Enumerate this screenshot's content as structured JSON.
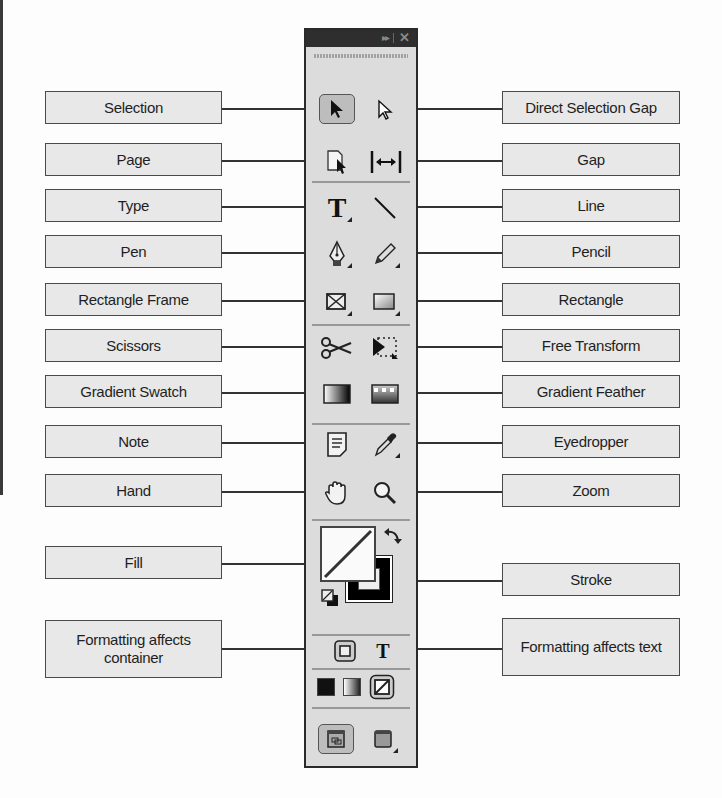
{
  "labels_left": [
    {
      "id": "selection",
      "text": "Selection"
    },
    {
      "id": "page",
      "text": "Page"
    },
    {
      "id": "type",
      "text": "Type"
    },
    {
      "id": "pen",
      "text": "Pen"
    },
    {
      "id": "rectangle-frame",
      "text": "Rectangle Frame"
    },
    {
      "id": "scissors",
      "text": "Scissors"
    },
    {
      "id": "gradient-swatch",
      "text": "Gradient Swatch"
    },
    {
      "id": "note",
      "text": "Note"
    },
    {
      "id": "hand",
      "text": "Hand"
    },
    {
      "id": "fill",
      "text": "Fill"
    },
    {
      "id": "formatting-container",
      "text": "Formatting affects container"
    }
  ],
  "labels_right": [
    {
      "id": "direct-selection",
      "text": "Direct Selection Gap"
    },
    {
      "id": "gap",
      "text": "Gap"
    },
    {
      "id": "line",
      "text": "Line"
    },
    {
      "id": "pencil",
      "text": "Pencil"
    },
    {
      "id": "rectangle",
      "text": "Rectangle"
    },
    {
      "id": "free-transform",
      "text": "Free Transform"
    },
    {
      "id": "gradient-feather",
      "text": "Gradient Feather"
    },
    {
      "id": "eyedropper",
      "text": "Eyedropper"
    },
    {
      "id": "zoom",
      "text": "Zoom"
    },
    {
      "id": "stroke",
      "text": "Stroke"
    },
    {
      "id": "formatting-text",
      "text": "Formatting affects text"
    }
  ],
  "panel": {
    "title_expand_icon": "▸▸",
    "title_close_icon": "✕",
    "type_glyph": "T",
    "formatting_text_glyph": "T"
  },
  "colors": {
    "panel_bg": "#dcdcdc",
    "titlebar": "#2e2e2e",
    "label_bg": "#e8e8e8",
    "border": "#4a4a4a"
  }
}
